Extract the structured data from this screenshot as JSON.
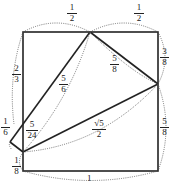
{
  "diagram": {
    "title": "",
    "square": {
      "side_label": "1"
    },
    "labels": {
      "top_left_half": {
        "num": "1",
        "den": "2"
      },
      "top_right_half": {
        "num": "1",
        "den": "2"
      },
      "left_upper": {
        "num": "2",
        "den": "3"
      },
      "left_mid": {
        "num": "1",
        "den": "6"
      },
      "left_bottom": {
        "num": "1",
        "den": "8"
      },
      "inner_small": {
        "num": "5",
        "den": "24"
      },
      "diag_left": {
        "num": "5",
        "den": "6"
      },
      "diag_right": {
        "num": "5",
        "den": "8"
      },
      "right_upper": {
        "num": "3",
        "den": "8"
      },
      "right_lower": {
        "num": "5",
        "den": "8"
      },
      "long_diag": {
        "num": "√5",
        "den": "2"
      },
      "bottom": "1"
    },
    "colors": {
      "line": "#222222",
      "dotted": "#555555",
      "background": "#ffffff"
    }
  }
}
